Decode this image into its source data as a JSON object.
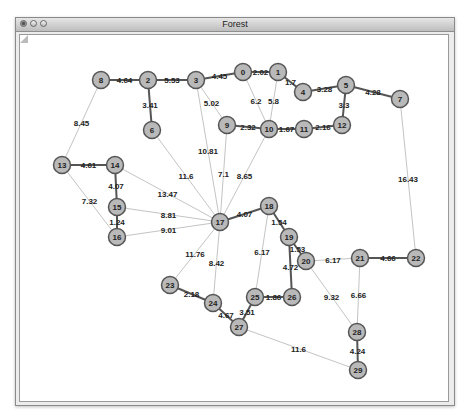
{
  "window": {
    "title": "Forest",
    "buttons": [
      "close",
      "minimize",
      "zoom"
    ]
  },
  "graph": {
    "node_fill": "#b9b9b9",
    "node_stroke": "#555555",
    "thick_edge_color": "#555555",
    "thin_edge_color": "#c4c4c4",
    "nodes": [
      {
        "id": "0",
        "x": 242,
        "y": 71
      },
      {
        "id": "1",
        "x": 277,
        "y": 71
      },
      {
        "id": "2",
        "x": 147,
        "y": 79
      },
      {
        "id": "3",
        "x": 195,
        "y": 79
      },
      {
        "id": "4",
        "x": 302,
        "y": 91
      },
      {
        "id": "5",
        "x": 345,
        "y": 84
      },
      {
        "id": "6",
        "x": 151,
        "y": 129
      },
      {
        "id": "7",
        "x": 399,
        "y": 98
      },
      {
        "id": "8",
        "x": 100,
        "y": 79
      },
      {
        "id": "9",
        "x": 226,
        "y": 124
      },
      {
        "id": "10",
        "x": 268,
        "y": 128
      },
      {
        "id": "11",
        "x": 303,
        "y": 128
      },
      {
        "id": "12",
        "x": 341,
        "y": 124
      },
      {
        "id": "13",
        "x": 61,
        "y": 164
      },
      {
        "id": "14",
        "x": 114,
        "y": 164
      },
      {
        "id": "15",
        "x": 116,
        "y": 206
      },
      {
        "id": "16",
        "x": 116,
        "y": 236
      },
      {
        "id": "17",
        "x": 219,
        "y": 221
      },
      {
        "id": "18",
        "x": 268,
        "y": 205
      },
      {
        "id": "19",
        "x": 288,
        "y": 236
      },
      {
        "id": "20",
        "x": 305,
        "y": 260
      },
      {
        "id": "21",
        "x": 359,
        "y": 257
      },
      {
        "id": "22",
        "x": 415,
        "y": 257
      },
      {
        "id": "23",
        "x": 169,
        "y": 284
      },
      {
        "id": "24",
        "x": 212,
        "y": 302
      },
      {
        "id": "25",
        "x": 254,
        "y": 296
      },
      {
        "id": "26",
        "x": 291,
        "y": 296
      },
      {
        "id": "27",
        "x": 238,
        "y": 326
      },
      {
        "id": "28",
        "x": 356,
        "y": 331
      },
      {
        "id": "29",
        "x": 357,
        "y": 369
      }
    ],
    "edges": [
      {
        "a": "0",
        "b": "1",
        "w": "2.02",
        "thick": true
      },
      {
        "a": "0",
        "b": "3",
        "w": "4.45",
        "thick": true
      },
      {
        "a": "0",
        "b": "10",
        "w": "6.2",
        "thick": false
      },
      {
        "a": "1",
        "b": "10",
        "w": "5.8",
        "thick": false
      },
      {
        "a": "1",
        "b": "4",
        "w": "1.7",
        "thick": true
      },
      {
        "a": "4",
        "b": "5",
        "w": "3.28",
        "thick": true
      },
      {
        "a": "5",
        "b": "7",
        "w": "4.28",
        "thick": true
      },
      {
        "a": "5",
        "b": "12",
        "w": "3.3",
        "thick": true
      },
      {
        "a": "8",
        "b": "2",
        "w": "4.64",
        "thick": true
      },
      {
        "a": "2",
        "b": "3",
        "w": "5.53",
        "thick": true
      },
      {
        "a": "2",
        "b": "6",
        "w": "3.41",
        "thick": true
      },
      {
        "a": "3",
        "b": "9",
        "w": "5.02",
        "thick": false
      },
      {
        "a": "9",
        "b": "10",
        "w": "2.32",
        "thick": true
      },
      {
        "a": "10",
        "b": "11",
        "w": "1.67",
        "thick": true
      },
      {
        "a": "11",
        "b": "12",
        "w": "2.16",
        "thick": true
      },
      {
        "a": "8",
        "b": "13",
        "w": "8.45",
        "thick": false
      },
      {
        "a": "7",
        "b": "22",
        "w": "16.43",
        "thick": false
      },
      {
        "a": "13",
        "b": "14",
        "w": "4.61",
        "thick": true
      },
      {
        "a": "14",
        "b": "15",
        "w": "4.07",
        "thick": true
      },
      {
        "a": "15",
        "b": "16",
        "w": "1.24",
        "thick": true
      },
      {
        "a": "13",
        "b": "16",
        "w": "7.32",
        "thick": false
      },
      {
        "a": "6",
        "b": "17",
        "w": "11.6",
        "thick": false
      },
      {
        "a": "3",
        "b": "17",
        "w": "10.81",
        "thick": false
      },
      {
        "a": "9",
        "b": "17",
        "w": "7.1",
        "thick": false
      },
      {
        "a": "10",
        "b": "17",
        "w": "8.65",
        "thick": false
      },
      {
        "a": "14",
        "b": "17",
        "w": "13.47",
        "thick": false
      },
      {
        "a": "15",
        "b": "17",
        "w": "8.81",
        "thick": false
      },
      {
        "a": "16",
        "b": "17",
        "w": "9.01",
        "thick": false
      },
      {
        "a": "17",
        "b": "18",
        "w": "4.07",
        "thick": true
      },
      {
        "a": "17",
        "b": "23",
        "w": "11.76",
        "thick": false
      },
      {
        "a": "17",
        "b": "24",
        "w": "8.42",
        "thick": false
      },
      {
        "a": "18",
        "b": "19",
        "w": "1.54",
        "thick": true
      },
      {
        "a": "18",
        "b": "25",
        "w": "6.17",
        "thick": false
      },
      {
        "a": "19",
        "b": "20",
        "w": "1.53",
        "thick": true
      },
      {
        "a": "19",
        "b": "26",
        "w": "4.72",
        "thick": true
      },
      {
        "a": "20",
        "b": "21",
        "w": "6.17",
        "thick": false
      },
      {
        "a": "20",
        "b": "28",
        "w": "9.32",
        "thick": false
      },
      {
        "a": "21",
        "b": "22",
        "w": "4.66",
        "thick": true
      },
      {
        "a": "21",
        "b": "28",
        "w": "6.66",
        "thick": false
      },
      {
        "a": "28",
        "b": "29",
        "w": "4.24",
        "thick": true
      },
      {
        "a": "23",
        "b": "24",
        "w": "2.18",
        "thick": true
      },
      {
        "a": "24",
        "b": "27",
        "w": "4.67",
        "thick": true
      },
      {
        "a": "25",
        "b": "26",
        "w": "1.86",
        "thick": true
      },
      {
        "a": "25",
        "b": "27",
        "w": "3.51",
        "thick": true
      },
      {
        "a": "27",
        "b": "29",
        "w": "11.6",
        "thick": false
      }
    ]
  }
}
